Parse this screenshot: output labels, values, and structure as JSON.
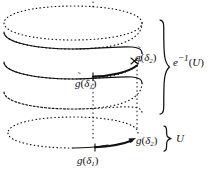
{
  "figure": {
    "kind": "covering-space-helix-diagram",
    "background_color": "#ffffff",
    "stroke_color": "#111111",
    "labels": {
      "lifted_path_end": {
        "base": "g",
        "accent": "tilde",
        "arg": "δ",
        "sub": "2"
      },
      "lifted_path_start": {
        "base": "g",
        "accent": "tilde",
        "arg": "δ",
        "sub": "1"
      },
      "path_end": {
        "base": "g",
        "accent": "none",
        "arg": "δ",
        "sub": "2"
      },
      "path_start": {
        "base": "g",
        "accent": "none",
        "arg": "δ",
        "sub": "1"
      },
      "preimage": {
        "base": "e",
        "exponent": "−1",
        "arg": "U"
      },
      "open_set": {
        "text": "U"
      }
    },
    "text": {
      "gtilde_delta2_fn": "g",
      "gtilde_delta2_tilde": "̃",
      "gtilde_delta2_open": "(",
      "gtilde_delta2_arg": "δ",
      "gtilde_delta2_sub": "2",
      "gtilde_delta2_close": ")",
      "gtilde_delta1_fn": "g",
      "gtilde_delta1_tilde": "̃",
      "gtilde_delta1_open": "(",
      "gtilde_delta1_arg": "δ",
      "gtilde_delta1_sub": "1",
      "gtilde_delta1_close": ")",
      "g_delta2_fn": "g",
      "g_delta2_open": "(",
      "g_delta2_arg": "δ",
      "g_delta2_sub": "2",
      "g_delta2_close": ")",
      "g_delta1_fn": "g",
      "g_delta1_open": "(",
      "g_delta1_arg": "δ",
      "g_delta1_sub": "1",
      "g_delta1_close": ")",
      "einv_fn": "e",
      "einv_sup": "−1",
      "einv_open": "(",
      "einv_arg": "U",
      "einv_close": ")",
      "u_text": "U"
    },
    "geometry": {
      "helix_turns": 3.5,
      "ellipse_rx": 69,
      "ellipse_ry": 15,
      "helix_center_x": 73,
      "helix_top_y": 16,
      "helix_pitch": 30,
      "base_circle_center_x": 73,
      "base_circle_center_y": 133,
      "tick_x": 93,
      "big_brace_top_y": 20,
      "big_brace_bottom_y": 114,
      "small_brace_top_y": 125,
      "small_brace_bottom_y": 147
    }
  }
}
